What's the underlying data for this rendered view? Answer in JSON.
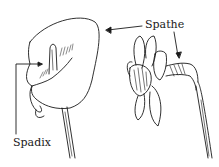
{
  "figure": {
    "type": "botanical-line-drawing",
    "labels": {
      "spathe": "Spathe",
      "spadix": "Spadix"
    },
    "subjects": [
      "calla-lily-flower",
      "daffodil-flower"
    ],
    "colors": {
      "ink": "#1a1a1a",
      "background": "#ffffff"
    }
  }
}
